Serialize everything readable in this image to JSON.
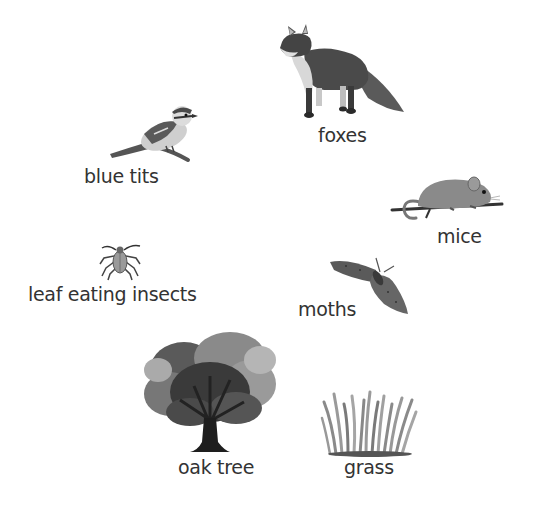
{
  "diagram": {
    "type": "food-web-organisms",
    "organisms": [
      {
        "id": "foxes",
        "label": "foxes",
        "icon": "fox-icon"
      },
      {
        "id": "blue-tits",
        "label": "blue tits",
        "icon": "blue-tit-bird-icon"
      },
      {
        "id": "mice",
        "label": "mice",
        "icon": "mouse-icon"
      },
      {
        "id": "leaf-eating-insects",
        "label": "leaf eating insects",
        "icon": "insect-icon"
      },
      {
        "id": "moths",
        "label": "moths",
        "icon": "moth-icon"
      },
      {
        "id": "oak-tree",
        "label": "oak tree",
        "icon": "oak-tree-icon"
      },
      {
        "id": "grass",
        "label": "grass",
        "icon": "grass-icon"
      }
    ],
    "colors": {
      "background": "#ffffff",
      "text": "#333333",
      "illustration_dark": "#3a3a3a",
      "illustration_mid": "#7a7a7a",
      "illustration_light": "#c8c8c8"
    }
  }
}
